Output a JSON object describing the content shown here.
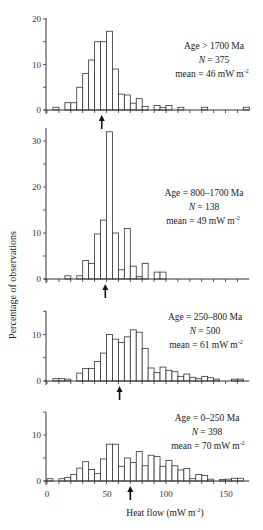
{
  "chart_data": [
    {
      "type": "bar",
      "panel": 1,
      "annotation": {
        "age": "Age > 1700 Ma",
        "n": "N = 375",
        "mean": "mean = 46 mW m-2"
      },
      "mean_arrow_x": 46,
      "bin_width": 5,
      "bins_start": [
        5,
        15,
        20,
        25,
        30,
        35,
        40,
        45,
        50,
        55,
        60,
        65,
        70,
        75,
        80,
        90,
        95,
        100,
        110,
        130,
        165
      ],
      "values": [
        0.6,
        1.6,
        1.6,
        5,
        8,
        11,
        15,
        15,
        17.3,
        9,
        3.5,
        3.3,
        1.5,
        2.5,
        0.8,
        1,
        0.6,
        1,
        0.6,
        0.6,
        0.6
      ],
      "ylim": [
        0,
        20
      ],
      "yticks": [
        0,
        10,
        20
      ]
    },
    {
      "type": "bar",
      "panel": 2,
      "annotation": {
        "age": "Age = 800–1700 Ma",
        "n": "N = 138",
        "mean": "mean = 49 mW m-2"
      },
      "mean_arrow_x": 49,
      "bin_width": 5,
      "bins_start": [
        15,
        25,
        30,
        35,
        40,
        45,
        50,
        55,
        60,
        65,
        70,
        75,
        80,
        90,
        95
      ],
      "values": [
        0.7,
        0.7,
        4,
        3.4,
        9.8,
        12.8,
        32,
        10,
        2,
        11,
        2.8,
        0.5,
        3.4,
        1.5,
        1.5
      ],
      "ylim": [
        0,
        33
      ],
      "yticks": [
        0,
        10,
        20,
        30
      ]
    },
    {
      "type": "bar",
      "panel": 3,
      "annotation": {
        "age": "Age = 250–800 Ma",
        "n": "N = 500",
        "mean": "mean = 61 mW m-2"
      },
      "mean_arrow_x": 61,
      "bin_width": 5,
      "bins_start": [
        5,
        10,
        15,
        25,
        30,
        35,
        40,
        45,
        50,
        55,
        60,
        65,
        70,
        75,
        80,
        85,
        90,
        95,
        100,
        105,
        110,
        115,
        120,
        125,
        130,
        135,
        140,
        155,
        160
      ],
      "values": [
        0.5,
        0.5,
        0.4,
        1.7,
        2.7,
        2.7,
        4.2,
        6,
        10,
        9,
        8.3,
        9.5,
        11,
        10.5,
        7,
        2.8,
        1.8,
        3,
        2.3,
        2,
        1,
        1.5,
        0.8,
        0.5,
        1,
        0.7,
        0.4,
        0.4,
        0.4
      ],
      "ylim": [
        0,
        15
      ],
      "yticks": [
        0,
        10
      ]
    },
    {
      "type": "bar",
      "panel": 4,
      "annotation": {
        "age": "Age = 0–250 Ma",
        "n": "N = 398",
        "mean": "mean = 70 mW m-2"
      },
      "mean_arrow_x": 70,
      "bin_width": 5,
      "bins_start": [
        0,
        10,
        15,
        20,
        25,
        30,
        35,
        40,
        45,
        50,
        55,
        60,
        65,
        70,
        75,
        80,
        85,
        90,
        95,
        100,
        105,
        110,
        115,
        120,
        125,
        130,
        135,
        145,
        150,
        155,
        160
      ],
      "values": [
        0.5,
        0.5,
        0.8,
        1.4,
        2.8,
        4.2,
        2.5,
        1.6,
        4.8,
        8,
        8,
        3.2,
        5,
        4,
        6.4,
        3.3,
        5.6,
        5.3,
        3.2,
        4.5,
        3.3,
        2.4,
        2.7,
        0.5,
        1.4,
        1.2,
        0.4,
        0.3,
        0.4,
        0.6,
        0.6
      ],
      "ylim": [
        0,
        15
      ],
      "yticks": [
        0,
        10
      ]
    }
  ],
  "axes": {
    "xlabel": "Heat flow  (mW m",
    "xlabel_sup": "-2",
    "xlabel_close": ")",
    "ylabel": "Percentage of observations",
    "xticks": [
      0,
      50,
      100,
      150
    ],
    "xlim": [
      0,
      170
    ]
  },
  "labels": {
    "p1_age": "Age > 1700 Ma",
    "p1_n_italic": "N",
    "p1_n_rest": " = 375",
    "p1_mean": "mean = 46 mW m",
    "sup": "-2",
    "p2_age": "Age = 800–1700 Ma",
    "p2_n_italic": "N",
    "p2_n_rest": " = 138",
    "p2_mean": "mean = 49 mW m",
    "p3_age": "Age = 250–800 Ma",
    "p3_n_italic": "N",
    "p3_n_rest": " = 500",
    "p3_mean": "mean = 61 mW m",
    "p4_age": "Age = 0–250 Ma",
    "p4_n_italic": "N",
    "p4_n_rest": " = 398",
    "p4_mean": "mean = 70 mW m",
    "ytick_0": "0",
    "ytick_10": "10",
    "ytick_20": "20",
    "ytick_30": "30",
    "xtick_0": "0",
    "xtick_50": "50",
    "xtick_100": "100",
    "xtick_150": "150"
  },
  "colors": {
    "bar_fill": "#ffffff",
    "bar_stroke": "#333333",
    "axis": "#333333"
  }
}
